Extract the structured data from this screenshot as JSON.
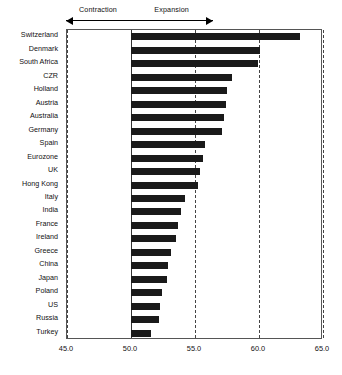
{
  "chart_data": {
    "type": "bar",
    "orientation": "horizontal",
    "title": "",
    "subtitle": "",
    "xlabel": "",
    "ylabel": "",
    "xlim": [
      45.0,
      65.0
    ],
    "xticks": [
      "45.0",
      "50.0",
      "55.0",
      "60.0",
      "65.0"
    ],
    "xtick_values": [
      45.0,
      50.0,
      55.0,
      60.0,
      65.0
    ],
    "grid": true,
    "gridline_style": "dashed",
    "baseline": 50.0,
    "legend": "none",
    "bar_color": "#1a1a1a",
    "categories": [
      "Switzerland",
      "Denmark",
      "South Africa",
      "CZR",
      "Holland",
      "Austria",
      "Australia",
      "Germany",
      "Spain",
      "Eurozone",
      "UK",
      "Hong Kong",
      "Italy",
      "India",
      "France",
      "Ireland",
      "Greece",
      "China",
      "Japan",
      "Poland",
      "US",
      "Russia",
      "Turkey"
    ],
    "values": [
      63.2,
      60.1,
      59.9,
      57.9,
      57.5,
      57.4,
      57.3,
      57.1,
      55.8,
      55.6,
      55.4,
      55.2,
      54.2,
      53.9,
      53.7,
      53.5,
      53.1,
      52.9,
      52.8,
      52.4,
      52.3,
      52.2,
      51.6
    ],
    "annotations": [
      {
        "text": "Contraction",
        "direction": "left",
        "from": 50.0,
        "to": 45.0
      },
      {
        "text": "Expansion",
        "direction": "right",
        "from": 50.0,
        "to": 56.5
      }
    ]
  }
}
